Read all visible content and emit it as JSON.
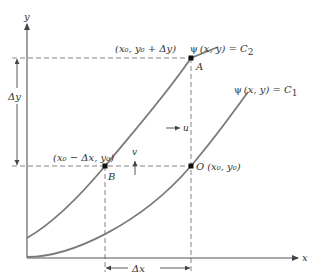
{
  "figure": {
    "axes": {
      "x_label": "x",
      "y_label": "y"
    },
    "curves": [
      {
        "id": "C2",
        "label": "ψ (x, y) = C₂",
        "label_psi": "ψ",
        "label_args": "(x, y) = C",
        "label_sub": "2"
      },
      {
        "id": "C1",
        "label": "ψ (x, y) = C₁",
        "label_psi": "ψ",
        "label_args": "(x, y) = C",
        "label_sub": "1"
      }
    ],
    "points": {
      "A": {
        "name": "A",
        "coord_label": "(x₀, y₀ + Δy)"
      },
      "B": {
        "name": "B",
        "coord_label": "(x₀ − Δx, y₀)"
      },
      "O": {
        "name": "O",
        "coord_label": "(x₀, y₀)"
      }
    },
    "velocity": {
      "u_label": "u",
      "v_label": "v"
    },
    "increments": {
      "dx_label": "Δx",
      "dy_label": "Δy"
    },
    "colors": {
      "curve": "#7a7a7a",
      "axis": "#555555",
      "dashed": "#777777",
      "point": "#111111",
      "text": "#333333"
    }
  }
}
